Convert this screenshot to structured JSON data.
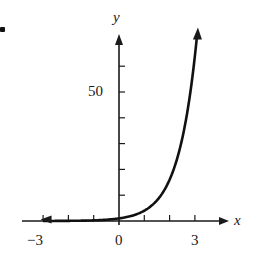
{
  "chart_data": {
    "type": "line",
    "title": "",
    "xlabel": "x",
    "ylabel": "y",
    "x_tick_labels": [
      "-3",
      "0",
      "3"
    ],
    "y_tick_labels": [
      "50"
    ],
    "x_ticks": [
      -3,
      -2,
      -1,
      0,
      1,
      2,
      3
    ],
    "y_ticks": [
      10,
      20,
      30,
      40,
      50,
      60
    ],
    "xlim": [
      -3.8,
      4.3
    ],
    "ylim": [
      0,
      72
    ],
    "grid": false,
    "legend": null,
    "series": [
      {
        "name": "y = 4^x",
        "x": [
          -3,
          -2.5,
          -2,
          -1.5,
          -1,
          -0.5,
          0,
          0.5,
          1,
          1.5,
          2,
          2.5,
          3.08
        ],
        "y": [
          0.016,
          0.031,
          0.063,
          0.125,
          0.25,
          0.5,
          1,
          2,
          4,
          8,
          16,
          32,
          72
        ]
      }
    ],
    "colors": {
      "axis": "#1a1a1a",
      "curve": "#111111"
    }
  },
  "labels": {
    "x_axis": "x",
    "y_axis": "y",
    "x_neg3": "−3",
    "x_0": "0",
    "x_3": "3",
    "y_50": "50"
  }
}
